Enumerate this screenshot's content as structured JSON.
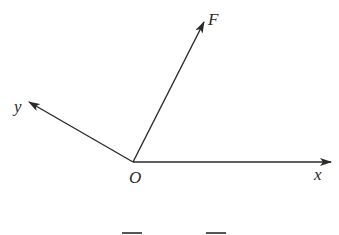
{
  "diagram": {
    "type": "vector-force-diagram",
    "origin": {
      "label": "O",
      "x": 133,
      "y": 162
    },
    "vectors": [
      {
        "name": "x-axis",
        "label": "x",
        "tip": {
          "x": 331,
          "y": 162
        }
      },
      {
        "name": "y-axis",
        "label": "y",
        "tip": {
          "x": 29,
          "y": 102
        }
      },
      {
        "name": "force",
        "label": "F",
        "tip": {
          "x": 204,
          "y": 22
        }
      }
    ],
    "line_color": "#2a2a2a"
  }
}
